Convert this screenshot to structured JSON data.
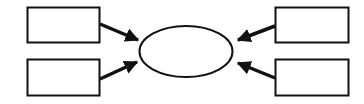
{
  "diagram": {
    "background": "#ffffff",
    "stroke_color": "#111111",
    "center_node": {
      "shape": "ellipse",
      "label": ""
    },
    "boxes": [
      {
        "id": "top-left",
        "label": ""
      },
      {
        "id": "bottom-left",
        "label": ""
      },
      {
        "id": "top-right",
        "label": ""
      },
      {
        "id": "bottom-right",
        "label": ""
      }
    ],
    "edges": [
      {
        "from": "top-left",
        "to": "center"
      },
      {
        "from": "bottom-left",
        "to": "center"
      },
      {
        "from": "top-right",
        "to": "center"
      },
      {
        "from": "bottom-right",
        "to": "center"
      }
    ]
  }
}
